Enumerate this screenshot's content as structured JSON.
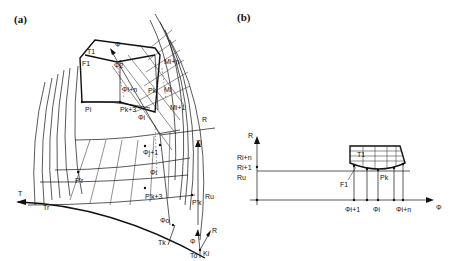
{
  "panels": {
    "a": {
      "label": "(a)",
      "labels": {
        "T1": "T1",
        "F1": "F1",
        "phi_axis": "Φ",
        "phi2": "Φ2",
        "phi_i_plus_n": "Φi+n",
        "phi_i_sub": "Φi",
        "phi_j_plus_1": "Φj+1",
        "phi_i": "Φi",
        "phi_o": "Φo",
        "M_i_plus_n": "Mi+n",
        "M_i": "Mi",
        "M_i_plus_1": "Mi+1",
        "P_i": "Pi",
        "P_k_plus_3": "Pk+3",
        "P_k": "Pk",
        "P1": "P1",
        "P_r_prime": "P'r",
        "P_k3_prime": "P'k+3",
        "P_k_prime": "P'k",
        "R_top": "R",
        "Z_i": "Zi",
        "R_u": "Ru",
        "T": "T",
        "T_r": "Tr",
        "T_k": "Tk",
        "T_o": "To",
        "K_i": "Ki",
        "phi_small": "Φ",
        "R_small": "R"
      }
    },
    "b": {
      "label": "(b)",
      "axes": {
        "y": "R",
        "x": "Φ"
      },
      "y_labels": [
        "Ri+n",
        "Ri+1",
        "Ru"
      ],
      "x_labels": [
        "Φi+1",
        "Φi",
        "Φi+n"
      ],
      "region_labels": {
        "T1": "T1",
        "F1": "F1",
        "Pk": "Pk"
      }
    }
  }
}
